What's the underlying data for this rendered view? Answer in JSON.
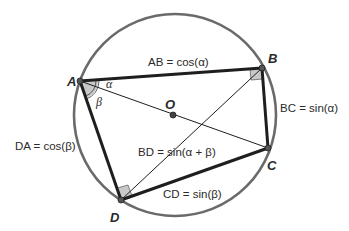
{
  "diagram": {
    "circle": {
      "center": "O",
      "stroke": "#6a6a6a"
    },
    "points": {
      "A": {
        "label": "A"
      },
      "B": {
        "label": "B"
      },
      "C": {
        "label": "C"
      },
      "D": {
        "label": "D"
      },
      "O": {
        "label": "O"
      }
    },
    "angles": {
      "alpha": "α",
      "beta": "β"
    },
    "equations": {
      "AB": "AB = cos(α)",
      "BC": "BC = sin(α)",
      "CD": "CD = sin(β)",
      "DA": "DA = cos(β)",
      "BD": "BD = sin(α + β)"
    },
    "colors": {
      "edge": "#1e1e1e",
      "circle": "#6a6a6a",
      "angle_fill": "#c8c8c8",
      "point_fill": "#555555"
    }
  }
}
